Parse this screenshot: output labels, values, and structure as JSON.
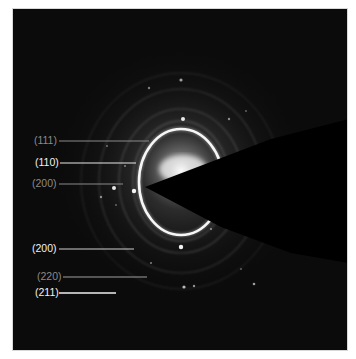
{
  "figure": {
    "type": "SAED diffraction pattern",
    "background_color": "#0b0b0b",
    "ring_color": "#f4f4f4",
    "beam_stop_color": "#000000"
  },
  "labels": [
    {
      "id": "l111",
      "text": "(111)",
      "style": "dim",
      "x": 34,
      "y": 134,
      "line_x1": 58,
      "line_x2": 148,
      "line_y": 140
    },
    {
      "id": "l110",
      "text": "(110)",
      "style": "bright",
      "x": 35,
      "y": 156,
      "line_x1": 59,
      "line_x2": 135,
      "line_y": 162
    },
    {
      "id": "l200a",
      "text": "(200)",
      "style": "dim",
      "x": 32,
      "y": 177,
      "line_x1": 58,
      "line_x2": 122,
      "line_y": 183
    },
    {
      "id": "l200b",
      "text": "(200)",
      "style": "bright",
      "x": 32,
      "y": 242,
      "line_x1": 58,
      "line_x2": 133,
      "line_y": 248
    },
    {
      "id": "l220",
      "text": "(220)",
      "style": "dim",
      "x": 37,
      "y": 270,
      "line_x1": 62,
      "line_x2": 146,
      "line_y": 276
    },
    {
      "id": "l211",
      "text": "(211)",
      "style": "bright",
      "x": 35,
      "y": 286,
      "line_x1": 58,
      "line_x2": 115,
      "line_y": 292
    }
  ]
}
